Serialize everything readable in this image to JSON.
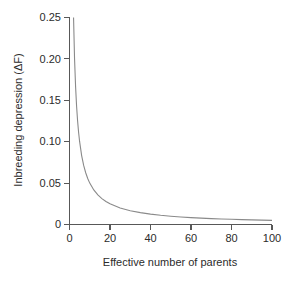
{
  "chart_data": {
    "type": "line",
    "title": "",
    "xlabel": "Effective number of parents",
    "ylabel": "Inbreeding depression (ΔF)",
    "xlim": [
      0,
      100
    ],
    "ylim": [
      0,
      0.25
    ],
    "xticks": [
      0,
      20,
      40,
      60,
      80,
      100
    ],
    "xticklabels": [
      "0",
      "20",
      "40",
      "60",
      "80",
      "100"
    ],
    "yticks": [
      0,
      0.05,
      0.1,
      0.15,
      0.2,
      0.25
    ],
    "yticklabels": [
      "0",
      "0.05",
      "0.10",
      "0.15",
      "0.20",
      "0.25"
    ],
    "grid": false,
    "legend": null,
    "series": [
      {
        "name": "ΔF = 1/(2N)",
        "color": "#8a8a8a",
        "x": [
          2,
          2.5,
          3,
          3.5,
          4,
          4.5,
          5,
          6,
          7,
          8,
          9,
          10,
          12,
          14,
          16,
          18,
          20,
          25,
          30,
          35,
          40,
          45,
          50,
          55,
          60,
          65,
          70,
          75,
          80,
          85,
          90,
          95,
          100
        ],
        "y": [
          0.25,
          0.2,
          0.1667,
          0.1429,
          0.125,
          0.1111,
          0.1,
          0.0833,
          0.0714,
          0.0625,
          0.0556,
          0.05,
          0.0417,
          0.0357,
          0.0313,
          0.0278,
          0.025,
          0.02,
          0.0167,
          0.0143,
          0.0125,
          0.0111,
          0.01,
          0.0091,
          0.0083,
          0.0077,
          0.0071,
          0.0067,
          0.0063,
          0.0059,
          0.0056,
          0.0053,
          0.005
        ]
      }
    ],
    "axis_color": "#585858",
    "background": "#ffffff"
  },
  "labels": {
    "y_axis_title": "Inbreeding depression (ΔF)",
    "x_axis_title": "Effective number of parents",
    "ytick_0": "0",
    "ytick_1": "0.05",
    "ytick_2": "0.10",
    "ytick_3": "0.15",
    "ytick_4": "0.20",
    "ytick_5": "0.25",
    "xtick_0": "0",
    "xtick_1": "20",
    "xtick_2": "40",
    "xtick_3": "60",
    "xtick_4": "80",
    "xtick_5": "100"
  }
}
